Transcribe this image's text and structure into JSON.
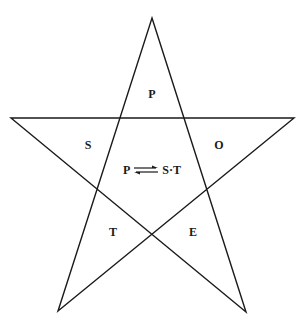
{
  "diagram": {
    "type": "pentagram",
    "stroke_color": "#1a1a1a",
    "vertices": {
      "top": [
        152,
        18
      ],
      "left": [
        11,
        118
      ],
      "right": [
        294,
        118
      ],
      "bottom_left": [
        58,
        311
      ],
      "bottom_right": [
        246,
        312
      ]
    },
    "points": [
      {
        "label": "P",
        "position": "top"
      },
      {
        "label": "S",
        "position": "upper-left"
      },
      {
        "label": "O",
        "position": "upper-right"
      },
      {
        "label": "T",
        "position": "lower-left"
      },
      {
        "label": "E",
        "position": "lower-right"
      }
    ],
    "center": {
      "left": "P",
      "arrow": "equilibrium",
      "right": "S·T"
    }
  }
}
